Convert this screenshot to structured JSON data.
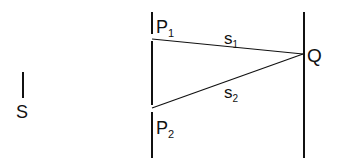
{
  "diagram": {
    "labels": {
      "source": "S",
      "slit1": "P",
      "slit1_sub": "1",
      "slit2": "P",
      "slit2_sub": "2",
      "point": "Q",
      "path1": "s",
      "path1_sub": "1",
      "path2": "s",
      "path2_sub": "2"
    },
    "colors": {
      "line": "#111111",
      "background": "#ffffff"
    }
  }
}
